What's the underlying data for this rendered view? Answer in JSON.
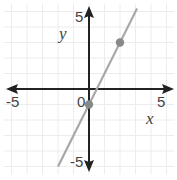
{
  "chart_data": {
    "type": "line",
    "title": "",
    "xlabel": "x",
    "ylabel": "y",
    "xlim": [
      -5.5,
      5.5
    ],
    "ylim": [
      -5.5,
      5.5
    ],
    "grid": true,
    "x_tick_labels": [
      "-5",
      "0",
      "5"
    ],
    "y_tick_labels": [
      "5",
      "-5"
    ],
    "series": [
      {
        "name": "line",
        "equation": "y = 2x - 1",
        "x": [
          -2,
          3.1
        ],
        "y": [
          -5,
          5.2
        ],
        "color": "#a8a8a8"
      }
    ],
    "points": [
      {
        "x": 0,
        "y": -1,
        "color": "#888888"
      },
      {
        "x": 2,
        "y": 3,
        "color": "#888888"
      }
    ]
  },
  "labels": {
    "x_neg5": "-5",
    "x_0": "0",
    "x_5": "5",
    "y_5": "5",
    "y_neg5": "-5",
    "x_axis": "x",
    "y_axis": "y"
  },
  "colors": {
    "axis": "#222222",
    "grid": "#ececec",
    "line": "#a8a8a8",
    "point": "#888888"
  }
}
